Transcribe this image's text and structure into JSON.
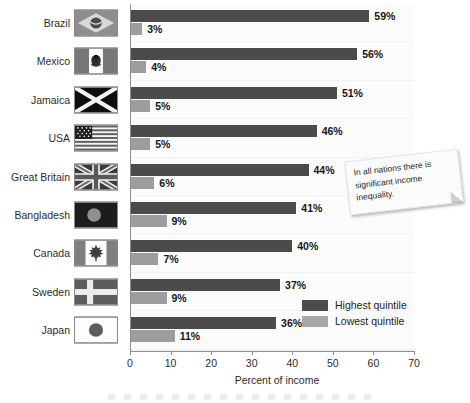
{
  "chart_data": {
    "type": "bar",
    "orientation": "horizontal",
    "title": "",
    "xlabel": "Percent of income",
    "ylabel": "",
    "xlim": [
      0,
      70
    ],
    "xticks": [
      0,
      10,
      20,
      30,
      40,
      50,
      60,
      70
    ],
    "grid": false,
    "legend_position": "inside-bottom-right",
    "categories": [
      "Brazil",
      "Mexico",
      "Jamaica",
      "USA",
      "Great Britain",
      "Bangladesh",
      "Canada",
      "Sweden",
      "Japan"
    ],
    "series": [
      {
        "name": "Highest quintile",
        "color": "#4b4b4b",
        "values": [
          59,
          56,
          51,
          46,
          44,
          41,
          40,
          37,
          36
        ],
        "labels": [
          "59%",
          "56%",
          "51%",
          "46%",
          "44%",
          "41%",
          "40%",
          "37%",
          "36%"
        ]
      },
      {
        "name": "Lowest quintile",
        "color": "#9d9d9d",
        "values": [
          3,
          4,
          5,
          5,
          6,
          9,
          7,
          9,
          11
        ],
        "labels": [
          "3%",
          "4%",
          "5%",
          "5%",
          "6%",
          "9%",
          "7%",
          "9%",
          "11%"
        ]
      }
    ],
    "annotations": [
      {
        "text": "In all nations there is significant income inequality.",
        "style": "sticky-note"
      }
    ]
  },
  "flags": [
    {
      "country": "Brazil",
      "icon": "flag-brazil"
    },
    {
      "country": "Mexico",
      "icon": "flag-mexico"
    },
    {
      "country": "Jamaica",
      "icon": "flag-jamaica"
    },
    {
      "country": "USA",
      "icon": "flag-usa"
    },
    {
      "country": "Great Britain",
      "icon": "flag-great-britain"
    },
    {
      "country": "Bangladesh",
      "icon": "flag-bangladesh"
    },
    {
      "country": "Canada",
      "icon": "flag-canada"
    },
    {
      "country": "Sweden",
      "icon": "flag-sweden"
    },
    {
      "country": "Japan",
      "icon": "flag-japan"
    }
  ],
  "legend": {
    "items": [
      {
        "label": "Highest quintile",
        "color": "#4b4b4b"
      },
      {
        "label": "Lowest quintile",
        "color": "#a7a7a7"
      }
    ]
  },
  "sticky_note": {
    "text": "In all nations there is significant income inequality."
  }
}
